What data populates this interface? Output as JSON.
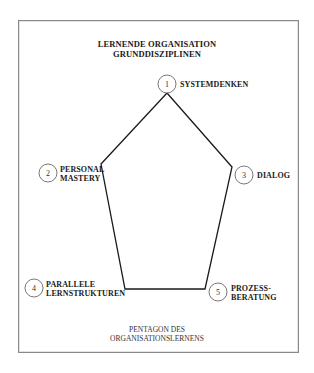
{
  "diagram": {
    "title_line1": "LERNENDE ORGANISATION",
    "title_line2": "GRUNDDISZIPLINEN",
    "caption_line1": "PENTAGON DES",
    "caption_line2": "ORGANISATIONSLERNENS",
    "shape": "pentagon",
    "line_color": "#1a1a1a",
    "frame_color": "#8a8a8a",
    "nodes": [
      {
        "number": "1",
        "label_line1": "SYSTEMDENKEN",
        "label_line2": ""
      },
      {
        "number": "2",
        "label_line1": "PERSONAL",
        "label_line2": "MASTERY"
      },
      {
        "number": "3",
        "label_line1": "DIALOG",
        "label_line2": ""
      },
      {
        "number": "4",
        "label_line1": "PARALLELE",
        "label_line2": "LERNSTRUKTUREN"
      },
      {
        "number": "5",
        "label_line1": "PROZESS-",
        "label_line2": "BERATUNG"
      }
    ]
  }
}
